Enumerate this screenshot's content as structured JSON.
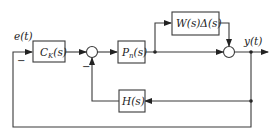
{
  "diagram": {
    "type": "feedback-control-block-diagram",
    "signals": {
      "input": "e(t)",
      "output": "y(t)"
    },
    "blocks": [
      {
        "id": "controller",
        "main": "C",
        "sub": "K",
        "arg": "(s)"
      },
      {
        "id": "nominal-plant",
        "main": "P",
        "sub": "n",
        "arg": "(s)"
      },
      {
        "id": "uncertainty",
        "label": "W(s)Δ(s)"
      },
      {
        "id": "inner-feedback",
        "label": "H(s)"
      }
    ],
    "summing_junctions": [
      {
        "id": "sum1",
        "signs": {
          "left": "+",
          "bottom": "−"
        }
      },
      {
        "id": "sum2",
        "signs": {
          "left": "+",
          "top": "+"
        }
      }
    ],
    "sign_labels": {
      "input_minus": "−",
      "sum1_minus": "−"
    }
  }
}
